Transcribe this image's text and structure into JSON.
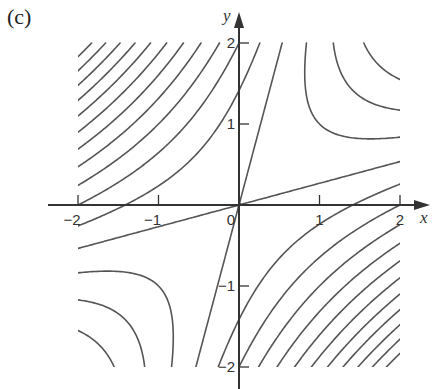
{
  "panel": {
    "label": "(c)"
  },
  "chart_data": {
    "type": "contour",
    "title": "(c)",
    "function": "x^2 - 4xy + y^2",
    "coefficients": {
      "xx": 1,
      "xy": -4,
      "yy": 1
    },
    "contour_levels": [
      -14,
      -12,
      -10,
      -8,
      -6,
      -4,
      -2,
      0,
      2,
      4,
      6,
      8,
      10,
      12,
      14,
      16,
      18,
      20,
      22
    ],
    "separatrix_slopes": [
      3.732,
      0.268
    ],
    "xlabel": "x",
    "ylabel": "y",
    "xlim": [
      -2,
      2
    ],
    "ylim": [
      -2,
      2
    ],
    "xticks": [
      -2,
      -1,
      0,
      1,
      2
    ],
    "yticks": [
      -2,
      -1,
      1,
      2
    ],
    "xtick_labels": [
      "−2",
      "−1",
      "0",
      "1",
      "2"
    ],
    "ytick_labels": [
      "−2",
      "−1",
      "1",
      "2"
    ],
    "grid": false,
    "line_color": "#555555",
    "axis_color": "#333333"
  }
}
